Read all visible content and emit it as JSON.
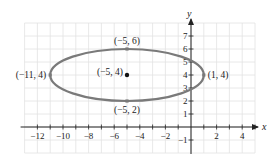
{
  "chart_data": {
    "type": "line",
    "title": "",
    "xlabel": "x",
    "ylabel": "y",
    "xlim": [
      -13,
      5
    ],
    "ylim": [
      -2,
      8
    ],
    "grid": true,
    "x_ticks": [
      -12,
      -10,
      -8,
      -6,
      -4,
      -2,
      2,
      4
    ],
    "x_tick_labels": [
      "−12",
      "−10",
      "−8",
      "−6",
      "−4",
      "−2",
      "2",
      "4"
    ],
    "y_ticks": [
      -1,
      1,
      2,
      3,
      4,
      5,
      6,
      7
    ],
    "y_tick_labels": [
      "−1",
      "1",
      "2",
      "3",
      "4",
      "5",
      "6",
      "7"
    ],
    "series": [
      {
        "name": "ellipse",
        "shape": "ellipse",
        "center": [
          -5,
          4
        ],
        "semi_major_x": 6,
        "semi_minor_y": 2,
        "color": "#7a7a7a"
      }
    ],
    "points": [
      {
        "x": -5,
        "y": 6,
        "label": "(−5, 6)",
        "marker": "vertex",
        "color": "#7a7a7a"
      },
      {
        "x": 1,
        "y": 4,
        "label": "(1, 4)",
        "marker": "vertex",
        "color": "#7a7a7a"
      },
      {
        "x": -11,
        "y": 4,
        "label": "(−11, 4)",
        "marker": "vertex",
        "color": "#7a7a7a"
      },
      {
        "x": -5,
        "y": 2,
        "label": "(−5, 2)",
        "marker": "vertex",
        "color": "#7a7a7a"
      },
      {
        "x": -5,
        "y": 4,
        "label": "(−5, 4)",
        "marker": "center",
        "color": "#111111"
      }
    ],
    "colors": {
      "grid": "#e2e2e2",
      "axis": "#222222",
      "curve": "#7a7a7a",
      "center": "#111111"
    }
  }
}
